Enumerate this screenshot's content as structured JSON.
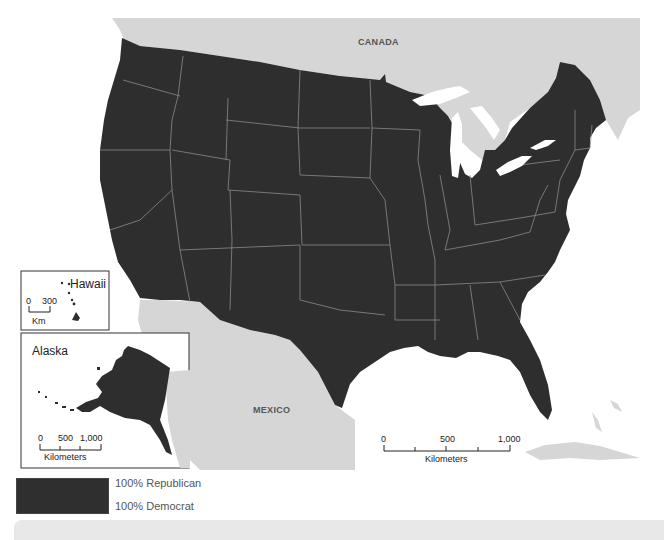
{
  "map": {
    "title": "County-level presidential vote, contiguous United States",
    "labels": {
      "canada": "CANADA",
      "mexico": "MEXICO"
    },
    "main_scale": {
      "ticks": [
        "0",
        "500",
        "1,000"
      ],
      "unit": "Kilometers"
    },
    "insets": {
      "hawaii": {
        "title": "Hawaii",
        "scale_ticks": [
          "0",
          "300"
        ],
        "scale_unit": "Km"
      },
      "alaska": {
        "title": "Alaska",
        "scale_ticks": [
          "0",
          "500",
          "1,000"
        ],
        "scale_unit": "Kilometers"
      }
    },
    "colors": {
      "us_fill": "#2e2e2e",
      "state_border": "#8a8a8a",
      "neighbor_fill": "#d6d6d6",
      "water": "#ffffff"
    }
  },
  "legend": {
    "top_label": "100% Republican",
    "bottom_label": "100% Democrat",
    "swatch_color": "#2f2f2f"
  }
}
